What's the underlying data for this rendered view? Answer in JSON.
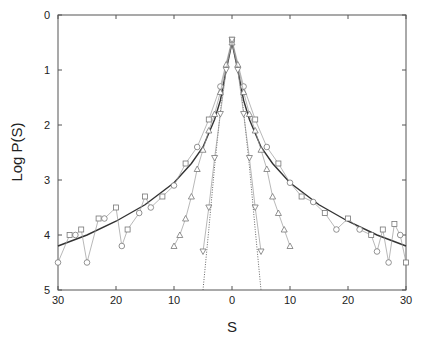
{
  "chart_data": {
    "type": "line",
    "title": "",
    "xlabel": "S",
    "ylabel": "Log P(S)",
    "xlim": [
      -30,
      30
    ],
    "ylim": [
      5,
      0
    ],
    "x_tick_labels": [
      "30",
      "20",
      "10",
      "0",
      "10",
      "20",
      "30"
    ],
    "y_tick_labels": [
      "0",
      "1",
      "2",
      "3",
      "4",
      "5"
    ],
    "grid": false,
    "legend": "none",
    "series": [
      {
        "name": "fit-solid",
        "style": "solid line",
        "x": [
          -30,
          -25,
          -20,
          -15,
          -10,
          -7,
          -5,
          -3,
          -2,
          -1,
          0,
          1,
          2,
          3,
          5,
          7,
          10,
          15,
          20,
          25,
          30
        ],
        "y": [
          4.2,
          4.0,
          3.75,
          3.45,
          3.05,
          2.7,
          2.4,
          1.9,
          1.55,
          1.0,
          0.5,
          1.0,
          1.55,
          1.9,
          2.4,
          2.7,
          3.05,
          3.45,
          3.75,
          4.0,
          4.2
        ]
      },
      {
        "name": "gaussian-dotted",
        "style": "dotted line",
        "x": [
          -5,
          -4,
          -3,
          -2,
          -1,
          0,
          1,
          2,
          3,
          4,
          5
        ],
        "y": [
          5.0,
          3.9,
          2.75,
          1.75,
          0.95,
          0.5,
          0.95,
          1.75,
          2.75,
          3.9,
          5.0
        ]
      },
      {
        "name": "circles-squares",
        "style": "circle/square markers",
        "x": [
          -30,
          -28,
          -27,
          -26,
          -25,
          -23,
          -22,
          -20,
          -19,
          -18,
          -16,
          -15,
          -14,
          -12,
          -10,
          -8,
          -6,
          -4,
          -2,
          0,
          2,
          4,
          6,
          8,
          10,
          12,
          14,
          16,
          18,
          20,
          22,
          24,
          25,
          26,
          27,
          28,
          29,
          30
        ],
        "y": [
          4.5,
          4.0,
          4.0,
          3.9,
          4.5,
          3.7,
          3.7,
          3.5,
          4.2,
          3.9,
          3.6,
          3.3,
          3.5,
          3.3,
          3.1,
          2.7,
          2.4,
          1.9,
          1.3,
          0.45,
          1.3,
          1.9,
          2.4,
          2.7,
          3.05,
          3.3,
          3.4,
          3.6,
          3.9,
          3.7,
          3.9,
          4.0,
          4.3,
          3.9,
          4.5,
          3.8,
          4.0,
          4.5
        ]
      },
      {
        "name": "triangles",
        "style": "triangle markers",
        "x": [
          -10,
          -9,
          -8,
          -7,
          -6,
          -5,
          -4,
          -3,
          -2,
          -1,
          0,
          1,
          2,
          3,
          4,
          5,
          6,
          7,
          8,
          9,
          10
        ],
        "y": [
          4.2,
          4.0,
          3.7,
          3.3,
          2.8,
          2.45,
          2.1,
          1.8,
          1.4,
          0.9,
          0.5,
          0.9,
          1.4,
          1.8,
          2.1,
          2.45,
          2.8,
          3.3,
          3.6,
          3.9,
          4.2
        ]
      },
      {
        "name": "inverted-triangles",
        "style": "inverted triangle markers",
        "x": [
          -5,
          -4,
          -3,
          -2,
          -1,
          0,
          1,
          2,
          3,
          4,
          5
        ],
        "y": [
          4.3,
          3.5,
          2.6,
          1.8,
          1.0,
          0.45,
          1.0,
          1.8,
          2.6,
          3.5,
          4.3
        ]
      }
    ]
  }
}
